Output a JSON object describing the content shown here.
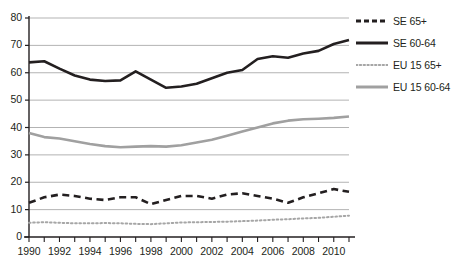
{
  "chart_data": {
    "type": "line",
    "title": "",
    "subtitle": "",
    "xlabel": "",
    "ylabel": "",
    "xlim": [
      1990,
      2011
    ],
    "ylim": [
      0,
      80
    ],
    "grid": true,
    "grid_axis": "y",
    "legend_position": "right",
    "x": [
      1990,
      1991,
      1992,
      1993,
      1994,
      1995,
      1996,
      1997,
      1998,
      1999,
      2000,
      2001,
      2002,
      2003,
      2004,
      2005,
      2006,
      2007,
      2008,
      2009,
      2010,
      2011
    ],
    "yticks": [
      0,
      10,
      20,
      30,
      40,
      50,
      60,
      70,
      80
    ],
    "ytick_labels": [
      "0",
      "10",
      "20",
      "30",
      "40",
      "50",
      "60",
      "70",
      "80"
    ],
    "xtick_labels": [
      "1990",
      "1992",
      "1994",
      "1996",
      "1998",
      "2000",
      "2002",
      "2004",
      "2006",
      "2008",
      "2010"
    ],
    "xticks_labeled": [
      1990,
      1992,
      1994,
      1996,
      1998,
      2000,
      2002,
      2004,
      2006,
      2008,
      2010
    ],
    "series": [
      {
        "name": "SE 65+",
        "style": "dashed",
        "color": "#231f20",
        "width": 2.6,
        "values": [
          12.5,
          14.5,
          15.5,
          15.0,
          14.0,
          13.5,
          14.5,
          14.5,
          12.0,
          13.5,
          15.0,
          15.0,
          14.0,
          15.5,
          16.0,
          15.0,
          14.0,
          12.5,
          14.5,
          16.0,
          17.5,
          16.5
        ]
      },
      {
        "name": "SE 60-64",
        "style": "solid",
        "color": "#231f20",
        "width": 2.6,
        "values": [
          63.8,
          64.2,
          61.5,
          59.0,
          57.5,
          57.0,
          57.2,
          60.5,
          57.5,
          54.5,
          55.0,
          56.0,
          58.0,
          60.0,
          61.0,
          65.0,
          66.0,
          65.5,
          67.0,
          68.0,
          70.5,
          72.0
        ]
      },
      {
        "name": "EU 15 65+",
        "style": "dotted",
        "color": "#a6a6a6",
        "width": 2.0,
        "values": [
          5.2,
          5.4,
          5.2,
          5.0,
          5.0,
          5.1,
          5.0,
          4.8,
          4.7,
          5.0,
          5.3,
          5.4,
          5.5,
          5.6,
          5.8,
          6.0,
          6.3,
          6.5,
          6.8,
          7.0,
          7.4,
          7.8
        ]
      },
      {
        "name": "EU 15 60-64",
        "style": "solid",
        "color": "#a0a0a0",
        "width": 2.6,
        "values": [
          38.0,
          36.5,
          36.0,
          35.0,
          34.0,
          33.2,
          32.8,
          33.0,
          33.2,
          33.0,
          33.5,
          34.5,
          35.5,
          37.0,
          38.5,
          40.0,
          41.5,
          42.5,
          43.0,
          43.2,
          43.5,
          44.0
        ]
      }
    ]
  },
  "axis": {
    "axis_color": "#231f20",
    "grid_color": "#b3b3b3"
  },
  "legend": {
    "entries": [
      {
        "label": "SE 65+",
        "style": "dashed",
        "color": "#231f20"
      },
      {
        "label": "SE 60-64",
        "style": "solid",
        "color": "#231f20"
      },
      {
        "label": "EU 15 65+",
        "style": "dotted",
        "color": "#a6a6a6"
      },
      {
        "label": "EU 15 60-64",
        "style": "solid",
        "color": "#a0a0a0"
      }
    ]
  }
}
